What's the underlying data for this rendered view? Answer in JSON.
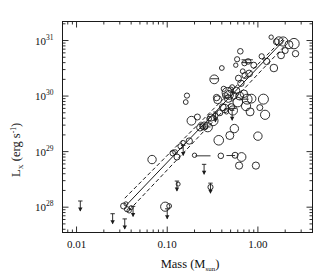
{
  "figure": {
    "title": "",
    "xlabel_main": "Mass (M",
    "xlabel_sub": "sun",
    "xlabel_close": ")",
    "ylabel_main": "L",
    "ylabel_sub": "X",
    "ylabel_rest": " (erg s",
    "ylabel_sup": "-1",
    "ylabel_close": ")",
    "frame_color": "#1a1a1a",
    "marker_color": "#1a1a1a",
    "fit_color": "#1a1a1a"
  },
  "chart_data": {
    "type": "scatter",
    "title": "",
    "xlabel": "Mass (M_sun)",
    "ylabel": "L_X (erg s^-1)",
    "xscale": "log",
    "yscale": "log",
    "xlim": [
      0.007,
      4.0
    ],
    "ylim": [
      3.5e+27,
      2.2e+31
    ],
    "grid": false,
    "legend": null,
    "xticks": [
      0.01,
      0.1,
      1.0
    ],
    "xticklabels": [
      "0.01",
      "0.10",
      "1.00"
    ],
    "yticks": [
      1e+28,
      1e+29,
      1e+30,
      1e+31
    ],
    "yticklabels": [
      "10^28",
      "10^29",
      "10^30",
      "10^31"
    ],
    "series": [
      {
        "name": "detections",
        "marker": "open-circle",
        "note": "size of circle scales with source significance; x=mass in Msun, y=Lx in erg/s, r=pixel radius",
        "points": [
          {
            "x": 0.033,
            "y": 1.05e+28,
            "r": 3.0
          },
          {
            "x": 0.036,
            "y": 9.2e+27,
            "r": 2.6
          },
          {
            "x": 0.038,
            "y": 8.6e+27,
            "r": 2.2
          },
          {
            "x": 0.04,
            "y": 9.8e+27,
            "r": 2.0
          },
          {
            "x": 0.035,
            "y": 1.15e+28,
            "r": 2.0
          },
          {
            "x": 0.068,
            "y": 7.2e+28,
            "r": 4.2
          },
          {
            "x": 0.095,
            "y": 1.02e+28,
            "r": 4.6
          },
          {
            "x": 0.105,
            "y": 1.05e+28,
            "r": 2.4
          },
          {
            "x": 0.115,
            "y": 9.4e+28,
            "r": 2.8
          },
          {
            "x": 0.122,
            "y": 9.8e+28,
            "r": 2.4
          },
          {
            "x": 0.128,
            "y": 8e+28,
            "r": 3.0
          },
          {
            "x": 0.132,
            "y": 2.6e+28,
            "r": 2.0
          },
          {
            "x": 0.14,
            "y": 1.25e+29,
            "r": 2.6
          },
          {
            "x": 0.15,
            "y": 1.45e+29,
            "r": 2.2
          },
          {
            "x": 0.16,
            "y": 7.8e+29,
            "r": 2.4
          },
          {
            "x": 0.165,
            "y": 1.02e+30,
            "r": 2.6
          },
          {
            "x": 0.175,
            "y": 1.55e+29,
            "r": 3.2
          },
          {
            "x": 0.185,
            "y": 3.6e+29,
            "r": 4.4
          },
          {
            "x": 0.2,
            "y": 8.6e+28,
            "r": 2.2
          },
          {
            "x": 0.215,
            "y": 4.2e+29,
            "r": 3.0
          },
          {
            "x": 0.23,
            "y": 2.7e+29,
            "r": 3.4
          },
          {
            "x": 0.245,
            "y": 2.85e+29,
            "r": 2.8
          },
          {
            "x": 0.255,
            "y": 2.9e+29,
            "r": 4.0
          },
          {
            "x": 0.265,
            "y": 2.8e+29,
            "r": 2.2
          },
          {
            "x": 0.28,
            "y": 2.75e+29,
            "r": 4.6
          },
          {
            "x": 0.29,
            "y": 3.9e+29,
            "r": 2.4
          },
          {
            "x": 0.3,
            "y": 2.3e+28,
            "r": 2.6
          },
          {
            "x": 0.305,
            "y": 4.1e+29,
            "r": 3.6
          },
          {
            "x": 0.32,
            "y": 3.6e+29,
            "r": 5.0
          },
          {
            "x": 0.33,
            "y": 2e+30,
            "r": 4.4
          },
          {
            "x": 0.34,
            "y": 4.4e+29,
            "r": 2.6
          },
          {
            "x": 0.35,
            "y": 9.4e+29,
            "r": 3.2
          },
          {
            "x": 0.36,
            "y": 8.6e+29,
            "r": 4.0
          },
          {
            "x": 0.37,
            "y": 1.6e+29,
            "r": 4.8
          },
          {
            "x": 0.38,
            "y": 5e+29,
            "r": 3.0
          },
          {
            "x": 0.39,
            "y": 8.4e+28,
            "r": 2.8
          },
          {
            "x": 0.4,
            "y": 3.2e+30,
            "r": 2.4
          },
          {
            "x": 0.41,
            "y": 6.3e+29,
            "r": 3.4
          },
          {
            "x": 0.42,
            "y": 1.35e+30,
            "r": 2.6
          },
          {
            "x": 0.43,
            "y": 6e+29,
            "r": 4.2
          },
          {
            "x": 0.44,
            "y": 1.02e+30,
            "r": 3.0
          },
          {
            "x": 0.45,
            "y": 5.2e+29,
            "r": 2.2
          },
          {
            "x": 0.46,
            "y": 1.15e+30,
            "r": 5.2
          },
          {
            "x": 0.47,
            "y": 9e+29,
            "r": 3.8
          },
          {
            "x": 0.48,
            "y": 1.05e+30,
            "r": 4.4
          },
          {
            "x": 0.49,
            "y": 1.95e+29,
            "r": 4.0
          },
          {
            "x": 0.5,
            "y": 1.3e+30,
            "r": 2.8
          },
          {
            "x": 0.51,
            "y": 6.4e+29,
            "r": 3.2
          },
          {
            "x": 0.52,
            "y": 1.45e+30,
            "r": 2.4
          },
          {
            "x": 0.53,
            "y": 5.5e+29,
            "r": 4.6
          },
          {
            "x": 0.54,
            "y": 1.02e+30,
            "r": 3.6
          },
          {
            "x": 0.55,
            "y": 2.6e+29,
            "r": 4.2
          },
          {
            "x": 0.56,
            "y": 8.6e+28,
            "r": 3.0
          },
          {
            "x": 0.57,
            "y": 3.6e+30,
            "r": 2.2
          },
          {
            "x": 0.58,
            "y": 1.25e+30,
            "r": 3.4
          },
          {
            "x": 0.59,
            "y": 4.6e+30,
            "r": 2.6
          },
          {
            "x": 0.6,
            "y": 7.8e+29,
            "r": 4.8
          },
          {
            "x": 0.61,
            "y": 2.1e+30,
            "r": 3.0
          },
          {
            "x": 0.62,
            "y": 5.6e+28,
            "r": 3.6
          },
          {
            "x": 0.63,
            "y": 1e+30,
            "r": 4.0
          },
          {
            "x": 0.64,
            "y": 6.4e+30,
            "r": 2.8
          },
          {
            "x": 0.65,
            "y": 1.7e+30,
            "r": 3.2
          },
          {
            "x": 0.66,
            "y": 8e+28,
            "r": 4.4
          },
          {
            "x": 0.68,
            "y": 2.8e+30,
            "r": 2.4
          },
          {
            "x": 0.7,
            "y": 1.1e+30,
            "r": 3.8
          },
          {
            "x": 0.71,
            "y": 3.9e+30,
            "r": 2.6
          },
          {
            "x": 0.72,
            "y": 2.35e+30,
            "r": 3.0
          },
          {
            "x": 0.74,
            "y": 6.6e+29,
            "r": 4.6
          },
          {
            "x": 0.76,
            "y": 8.8e+29,
            "r": 5.0
          },
          {
            "x": 0.78,
            "y": 4.2e+30,
            "r": 2.8
          },
          {
            "x": 0.8,
            "y": 2.55e+30,
            "r": 3.4
          },
          {
            "x": 0.82,
            "y": 5.2e+29,
            "r": 4.0
          },
          {
            "x": 0.85,
            "y": 9e+29,
            "r": 4.4
          },
          {
            "x": 0.9,
            "y": 3.6e+30,
            "r": 3.0
          },
          {
            "x": 0.95,
            "y": 5.6e+28,
            "r": 3.6
          },
          {
            "x": 1.0,
            "y": 1.9e+29,
            "r": 4.2
          },
          {
            "x": 1.05,
            "y": 6.2e+29,
            "r": 3.0
          },
          {
            "x": 1.1,
            "y": 5.2e+30,
            "r": 2.6
          },
          {
            "x": 1.15,
            "y": 8.8e+29,
            "r": 5.0
          },
          {
            "x": 1.2,
            "y": 4.6e+29,
            "r": 4.6
          },
          {
            "x": 1.25,
            "y": 4.2e+30,
            "r": 3.2
          },
          {
            "x": 1.4,
            "y": 1.15e+31,
            "r": 2.2
          },
          {
            "x": 1.5,
            "y": 3.2e+30,
            "r": 3.8
          },
          {
            "x": 1.6,
            "y": 9.5e+30,
            "r": 3.0
          },
          {
            "x": 1.7,
            "y": 9.8e+30,
            "r": 4.2
          },
          {
            "x": 1.8,
            "y": 5.4e+30,
            "r": 3.4
          },
          {
            "x": 1.9,
            "y": 9.6e+30,
            "r": 4.6
          },
          {
            "x": 2.0,
            "y": 6.6e+30,
            "r": 3.0
          },
          {
            "x": 2.2,
            "y": 8.4e+30,
            "r": 4.0
          },
          {
            "x": 2.5,
            "y": 8.8e+30,
            "r": 5.2
          },
          {
            "x": 2.6,
            "y": 5.8e+30,
            "r": 3.2
          }
        ]
      },
      {
        "name": "upper-limits",
        "marker": "down-arrow",
        "note": "downward arrows denote X-ray upper limits",
        "points": [
          {
            "x": 0.011,
            "y": 1.05e+28
          },
          {
            "x": 0.025,
            "y": 6.2e+27
          },
          {
            "x": 0.034,
            "y": 5e+27
          },
          {
            "x": 0.042,
            "y": 8.4e+27
          },
          {
            "x": 0.1,
            "y": 7.6e+27
          },
          {
            "x": 0.128,
            "y": 2.4e+28
          },
          {
            "x": 0.15,
            "y": 1.05e+29
          },
          {
            "x": 0.255,
            "y": 4.8e+28
          },
          {
            "x": 0.3,
            "y": 2.2e+28
          },
          {
            "x": 0.34,
            "y": 4.2e+29
          },
          {
            "x": 0.52,
            "y": 4.5e+29
          }
        ]
      },
      {
        "name": "mass-range-connectors",
        "marker": "horizontal-line",
        "note": "horizontal bars linking alternative mass estimates for the same source",
        "segments": [
          {
            "x1": 0.205,
            "x2": 0.3,
            "y": 8.4e+28
          },
          {
            "x1": 0.235,
            "x2": 0.3,
            "y": 2.78e+29
          },
          {
            "x1": 0.3,
            "x2": 0.37,
            "y": 2.05e+30
          },
          {
            "x1": 0.43,
            "x2": 0.58,
            "y": 6e+29
          },
          {
            "x1": 0.45,
            "x2": 0.56,
            "y": 8.5e+28
          },
          {
            "x1": 0.62,
            "x2": 0.79,
            "y": 8.8e+29
          },
          {
            "x1": 0.66,
            "x2": 0.88,
            "y": 4e+30
          },
          {
            "x1": 0.66,
            "x2": 0.88,
            "y": 4.5e+30
          }
        ]
      },
      {
        "name": "regression-fit",
        "marker": "solid-line",
        "note": "best-fit power law through the Lx-mass relation",
        "endpoints": [
          {
            "x": 0.036,
            "y": 1.12e+28
          },
          {
            "x": 1.95,
            "y": 1.02e+31
          }
        ]
      },
      {
        "name": "confidence-band-upper",
        "marker": "dashed-line",
        "endpoints": [
          {
            "x": 0.034,
            "y": 1.45e+28
          },
          {
            "x": 1.95,
            "y": 1.12e+31
          }
        ]
      },
      {
        "name": "confidence-band-lower",
        "marker": "dashed-line",
        "endpoints": [
          {
            "x": 0.038,
            "y": 8.8e+27
          },
          {
            "x": 2.0,
            "y": 8.2e+30
          }
        ]
      }
    ]
  }
}
